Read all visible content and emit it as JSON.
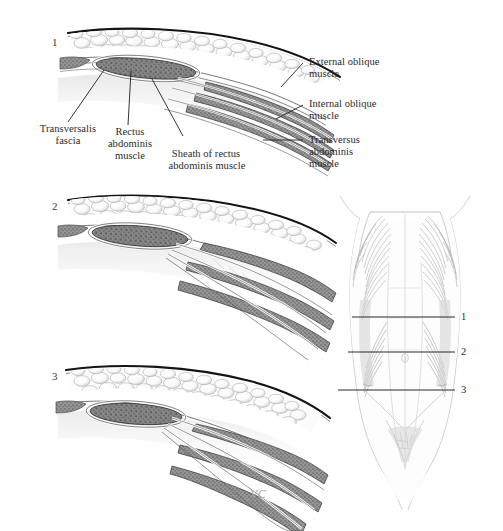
{
  "figure": {
    "background_color": "#ffffff",
    "ink_color": "#2b2b2b"
  },
  "panels": [
    {
      "id": "panel-1",
      "number": "1"
    },
    {
      "id": "panel-2",
      "number": "2"
    },
    {
      "id": "panel-3",
      "number": "3"
    }
  ],
  "labels": {
    "external_oblique": "External oblique\nmuscle",
    "external_oblique_l1": "External oblique",
    "external_oblique_l2": "muscle",
    "internal_oblique_l1": "Internal oblique",
    "internal_oblique_l2": "muscle",
    "transversus_l1": "Transversus",
    "transversus_l2": "abdominis",
    "transversus_l3": "muscle",
    "transversalis_l1": "Transversalis",
    "transversalis_l2": "fascia",
    "rectus_l1": "Rectus",
    "rectus_l2": "abdominis",
    "rectus_l3": "muscle",
    "sheath_l1": "Sheath of rectus",
    "sheath_l2": "abdominis muscle"
  },
  "torso": {
    "name": "anterior-abdominal-wall-torso",
    "cut_levels": [
      {
        "number": "1"
      },
      {
        "number": "2"
      },
      {
        "number": "3"
      }
    ]
  },
  "signature": "VC",
  "colors": {
    "fat": "#fbfbfb",
    "fat_outline": "#9a9a9a",
    "muscle_fill": "#8a8a8a",
    "muscle_dark": "#5f5f5f",
    "skin_line": "#1a1a1a",
    "fascia": "#cfcfcf",
    "torso_line": "#b9b9b9",
    "leader_line": "#2b2b2b"
  }
}
